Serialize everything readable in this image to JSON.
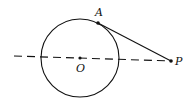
{
  "diagram": {
    "type": "geometry",
    "colors": {
      "stroke": "#111111",
      "background": "#ffffff"
    },
    "circle": {
      "center_label": "O",
      "cx": 80,
      "cy": 58,
      "r": 39
    },
    "points": [
      {
        "label": "A",
        "x": 98,
        "y": 23,
        "label_x": 95,
        "label_y": 16
      },
      {
        "label": "O",
        "x": 80,
        "y": 58,
        "label_x": 76,
        "label_y": 72
      },
      {
        "label": "P",
        "x": 171,
        "y": 61,
        "label_x": 175,
        "label_y": 65
      }
    ],
    "segments": [
      {
        "from": "A",
        "to": "P",
        "style": "solid"
      },
      {
        "from": "line-start",
        "to": "P",
        "style": "dashed",
        "x1": 14,
        "y1": 56
      }
    ]
  }
}
